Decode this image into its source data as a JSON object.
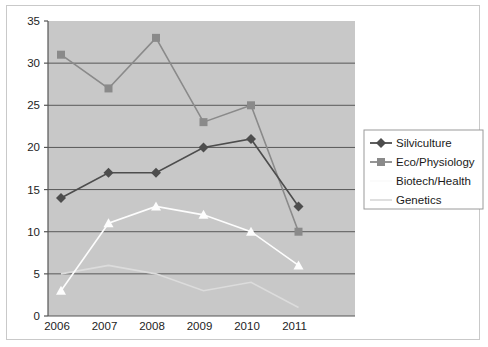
{
  "chart_data": {
    "type": "line",
    "title": "",
    "subtitle": "",
    "xlabel": "",
    "ylabel": "",
    "xlim": [
      0,
      7
    ],
    "ylim": [
      0,
      35
    ],
    "ytick_step": 5,
    "yticks": [
      "0",
      "5",
      "10",
      "15",
      "20",
      "25",
      "30",
      "35"
    ],
    "grid": "horizontal",
    "legend_position": "right",
    "categories": [
      "2006",
      "2007",
      "2008",
      "2009",
      "2010",
      "2011"
    ],
    "series": [
      {
        "name": "Silviculture",
        "marker": "diamond",
        "color": "#4d4d4d",
        "values": [
          14,
          17,
          17,
          20,
          21,
          13
        ]
      },
      {
        "name": "Eco/Physiology",
        "marker": "square",
        "color": "#8a8a8a",
        "values": [
          31,
          27,
          33,
          23,
          25,
          10
        ]
      },
      {
        "name": "Biotech/Health",
        "marker": "triangle",
        "color": "#fdfdfd",
        "values": [
          3,
          11,
          13,
          12,
          10,
          6
        ]
      },
      {
        "name": "Genetics",
        "marker": "none",
        "color": "#dcdcdc",
        "values": [
          5,
          6,
          5,
          3,
          4,
          1
        ]
      }
    ]
  },
  "plot": {
    "background_color": "#c8c8c8",
    "gridline_color": "#585858",
    "axis_color": "#555555",
    "frame_color": "#c9c9c9",
    "page_background": "#ffffff"
  },
  "legend": {
    "border_color": "#9a9a9a",
    "items": [
      {
        "label": "Silviculture",
        "marker": "diamond",
        "color": "#4d4d4d",
        "show_line": true
      },
      {
        "label": "Eco/Physiology",
        "marker": "square",
        "color": "#8a8a8a",
        "show_line": true
      },
      {
        "label": "Biotech/Health",
        "marker": "none",
        "color": "#fbfbfb",
        "show_line": true
      },
      {
        "label": "Genetics",
        "marker": "none",
        "color": "#dcdcdc",
        "show_line": true
      }
    ]
  }
}
